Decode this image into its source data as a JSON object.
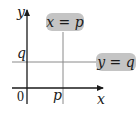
{
  "diagram": {
    "axes": {
      "x_label": "x",
      "y_label": "y",
      "origin_label": "0"
    },
    "ticks": {
      "x_tick": "p",
      "y_tick": "q"
    },
    "lines": [
      {
        "equation": "x = p",
        "orientation": "vertical"
      },
      {
        "equation": "y = q",
        "orientation": "horizontal"
      }
    ],
    "colors": {
      "axis": "#1a1a1a",
      "guide_line": "#8a8a8a",
      "label_box": "#c4c4c4",
      "background": "#ffffff"
    }
  }
}
